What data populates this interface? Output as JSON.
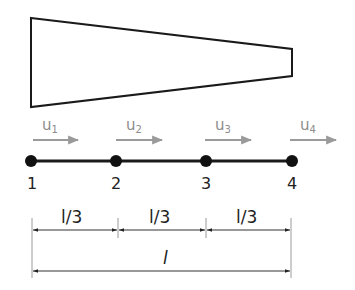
{
  "figure": {
    "shape": {
      "type": "tapered-bar",
      "stroke": "#1a1a1a"
    },
    "element": {
      "line_color": "#1a1a1a",
      "node_color": "#111111"
    },
    "nodes": [
      {
        "label": "1",
        "displacement": {
          "base": "u",
          "sub": "1"
        }
      },
      {
        "label": "2",
        "displacement": {
          "base": "u",
          "sub": "2"
        }
      },
      {
        "label": "3",
        "displacement": {
          "base": "u",
          "sub": "3"
        }
      },
      {
        "label": "4",
        "displacement": {
          "base": "u",
          "sub": "4"
        }
      }
    ],
    "arrow_color": "#9a9a9a",
    "dimensions": {
      "segments": [
        {
          "label": "l/3"
        },
        {
          "label": "l/3"
        },
        {
          "label": "l/3"
        }
      ],
      "total": {
        "label": "l"
      },
      "line_color": "#333333",
      "extension_color": "#9a9a9a"
    }
  }
}
